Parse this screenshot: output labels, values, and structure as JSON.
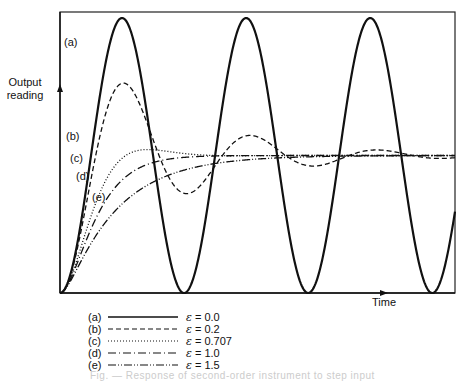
{
  "chart_data": {
    "type": "line",
    "title": "",
    "xlabel": "Time",
    "ylabel": "Output reading",
    "grid": false,
    "legend_position": "below",
    "x_unit": "normalized time (omega_n * t, rad)",
    "x_range": [
      0,
      20
    ],
    "y_range": [
      0,
      2
    ],
    "steady_state": 1.0,
    "series": [
      {
        "key": "a",
        "label": "(a)",
        "epsilon": 0.0,
        "epsilon_text": "0.0",
        "style": "solid",
        "dash": ""
      },
      {
        "key": "b",
        "label": "(b)",
        "epsilon": 0.2,
        "epsilon_text": "0.2",
        "style": "dashed",
        "dash": "5,3"
      },
      {
        "key": "c",
        "label": "(c)",
        "epsilon": 0.707,
        "epsilon_text": "0.707",
        "style": "dotted",
        "dash": "1,2"
      },
      {
        "key": "d",
        "label": "(d)",
        "epsilon": 1.0,
        "epsilon_text": "1.0",
        "style": "dash-dot",
        "dash": "8,3,1,3"
      },
      {
        "key": "e",
        "label": "(e)",
        "epsilon": 1.5,
        "epsilon_text": "1.5",
        "style": "dash-dot-dot",
        "dash": "8,2,1,2,1,2"
      }
    ],
    "annotations": [
      {
        "text": "(a)",
        "near": "first peak of curve a"
      },
      {
        "text": "(b)",
        "near": "rising edge of curve b"
      },
      {
        "text": "(c)",
        "near": "rising edge of curve c"
      },
      {
        "text": "(d)",
        "near": "rising edge of curve d"
      },
      {
        "text": "(e)",
        "near": "rising edge of curve e"
      }
    ]
  },
  "labels": {
    "y_axis": "Output\nreading",
    "y_line1": "Output",
    "y_line2": "reading",
    "x_axis": "Time",
    "epsilon_symbol": "ε",
    "equals": " = "
  },
  "caption": "Fig. — Response of second-order instrument to step input"
}
